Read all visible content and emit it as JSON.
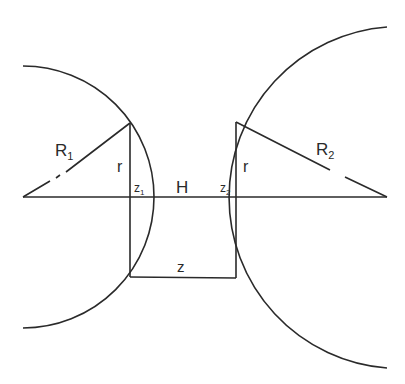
{
  "diagram": {
    "labels": {
      "R1": "R",
      "R1_sub": "1",
      "R2": "R",
      "R2_sub": "2",
      "r_left": "r",
      "r_right": "r",
      "z1": "z",
      "z1_sub": "1",
      "z2": "z",
      "z2_sub": "2",
      "H": "H",
      "z": "z"
    },
    "geometry": {
      "left_circle": {
        "cx": 23,
        "cy": 197,
        "r": 131
      },
      "right_circle": {
        "cx": 387,
        "cy": 197,
        "r": 171
      },
      "axis_y": 197,
      "left_chord_x": 130,
      "right_chord_x": 236,
      "bottom_line_y": 277
    },
    "colors": {
      "line": "#2a2a2a",
      "background": "#ffffff"
    }
  }
}
